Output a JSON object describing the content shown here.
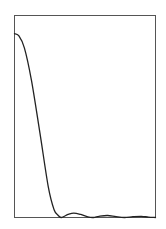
{
  "chart_data": {
    "type": "line",
    "title": "",
    "xlabel": "",
    "ylabel": "",
    "grid": false,
    "legend": null,
    "xlim": [
      0,
      1
    ],
    "ylim": [
      0,
      1
    ],
    "series": [
      {
        "name": "response",
        "color": "#222222",
        "x": [
          0.0,
          0.03,
          0.07,
          0.12,
          0.18,
          0.24,
          0.28,
          0.31,
          0.33,
          0.35,
          0.38,
          0.42,
          0.47,
          0.52,
          0.56,
          0.6,
          0.66,
          0.72,
          0.78,
          0.84,
          0.9,
          0.95,
          1.0
        ],
        "values": [
          0.91,
          0.9,
          0.84,
          0.68,
          0.42,
          0.15,
          0.04,
          0.01,
          0.0,
          0.005,
          0.015,
          0.022,
          0.015,
          0.003,
          0.0,
          0.006,
          0.01,
          0.004,
          0.0,
          0.004,
          0.006,
          0.002,
          0.0
        ]
      }
    ]
  },
  "frame": {
    "stroke": "#555555",
    "background": "#ffffff"
  }
}
